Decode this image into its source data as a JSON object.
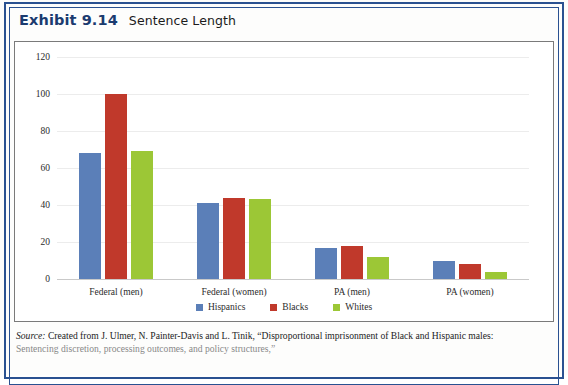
{
  "exhibit": {
    "number": "Exhibit 9.14",
    "title": "Sentence Length"
  },
  "source": {
    "label": "Source:",
    "line1": "Created from J. Ulmer, N. Painter-Davis and L. Tinik, “Disproportional imprisonment of Black and Hispanic males:",
    "line2": "Sentencing discretion, processing outcomes, and policy structures,”"
  },
  "colors": {
    "hispanics": "#5b7fb8",
    "blacks": "#c0392b",
    "whites": "#9cc736",
    "frame": "#2a5191",
    "plot_border": "#7a7a7a",
    "gridline": "#ececec"
  },
  "chart_data": {
    "type": "bar",
    "title": "Sentence Length",
    "xlabel": "",
    "ylabel": "",
    "ylim": [
      0,
      120
    ],
    "yticks": [
      0,
      20,
      40,
      60,
      80,
      100,
      120
    ],
    "grid": true,
    "legend_position": "bottom",
    "categories": [
      "Federal (men)",
      "Federal (women)",
      "PA (men)",
      "PA (women)"
    ],
    "series": [
      {
        "name": "Hispanics",
        "color": "#5b7fb8",
        "values": [
          68,
          41,
          17,
          10
        ]
      },
      {
        "name": "Blacks",
        "color": "#c0392b",
        "values": [
          100,
          44,
          18,
          8
        ]
      },
      {
        "name": "Whites",
        "color": "#9cc736",
        "values": [
          69,
          43,
          12,
          4
        ]
      }
    ]
  }
}
